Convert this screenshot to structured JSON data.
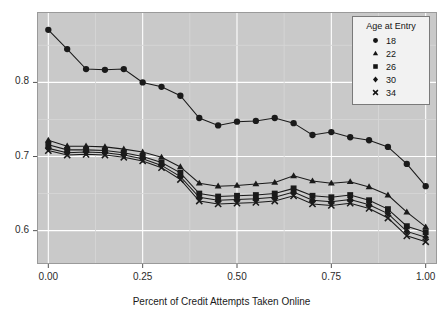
{
  "chart_data": {
    "type": "line",
    "title": "",
    "xlabel": "Percent of Credit Attempts Taken Online",
    "ylabel": "",
    "xlim": [
      -0.03,
      1.03
    ],
    "ylim": [
      0.555,
      0.895
    ],
    "xticks": [
      0.0,
      0.25,
      0.5,
      0.75,
      1.0
    ],
    "xtick_labels": [
      "0.00",
      "0.25",
      "0.50",
      "0.75",
      "1.00"
    ],
    "yticks": [
      0.6,
      0.7,
      0.8
    ],
    "ytick_labels": [
      "0.6",
      "0.7",
      "0.8"
    ],
    "grid": true,
    "grid_color": "#ffffff",
    "panel_color": "#c9c9c9",
    "legend": {
      "title": "Age at Entry",
      "position": "top-right",
      "entries": [
        {
          "label": "18",
          "marker": "circle"
        },
        {
          "label": "22",
          "marker": "triangle"
        },
        {
          "label": "26",
          "marker": "square"
        },
        {
          "label": "30",
          "marker": "diamond"
        },
        {
          "label": "34",
          "marker": "cross"
        }
      ]
    },
    "x": [
      0.0,
      0.05,
      0.1,
      0.15,
      0.2,
      0.25,
      0.3,
      0.35,
      0.4,
      0.45,
      0.5,
      0.55,
      0.6,
      0.65,
      0.7,
      0.75,
      0.8,
      0.85,
      0.9,
      0.95,
      1.0
    ],
    "series": [
      {
        "name": "18",
        "marker": "circle",
        "color": "#1a1a1a",
        "values": [
          0.871,
          0.845,
          0.818,
          0.817,
          0.818,
          0.8,
          0.794,
          0.782,
          0.752,
          0.742,
          0.747,
          0.748,
          0.752,
          0.745,
          0.729,
          0.733,
          0.726,
          0.722,
          0.713,
          0.69,
          0.66
        ]
      },
      {
        "name": "22",
        "marker": "triangle",
        "color": "#1a1a1a",
        "values": [
          0.722,
          0.714,
          0.714,
          0.713,
          0.71,
          0.706,
          0.699,
          0.686,
          0.664,
          0.66,
          0.661,
          0.663,
          0.665,
          0.674,
          0.667,
          0.664,
          0.666,
          0.659,
          0.648,
          0.625,
          0.605
        ]
      },
      {
        "name": "26",
        "marker": "square",
        "color": "#1a1a1a",
        "values": [
          0.716,
          0.709,
          0.709,
          0.708,
          0.705,
          0.7,
          0.692,
          0.678,
          0.65,
          0.646,
          0.647,
          0.648,
          0.65,
          0.657,
          0.647,
          0.645,
          0.648,
          0.641,
          0.629,
          0.606,
          0.598
        ]
      },
      {
        "name": "30",
        "marker": "diamond",
        "color": "#1a1a1a",
        "values": [
          0.711,
          0.705,
          0.706,
          0.705,
          0.702,
          0.697,
          0.688,
          0.673,
          0.645,
          0.641,
          0.642,
          0.643,
          0.645,
          0.652,
          0.641,
          0.639,
          0.642,
          0.635,
          0.623,
          0.599,
          0.591
        ]
      },
      {
        "name": "34",
        "marker": "cross",
        "color": "#1a1a1a",
        "values": [
          0.708,
          0.702,
          0.703,
          0.702,
          0.699,
          0.694,
          0.685,
          0.669,
          0.64,
          0.636,
          0.637,
          0.638,
          0.64,
          0.647,
          0.636,
          0.634,
          0.637,
          0.63,
          0.617,
          0.593,
          0.585
        ]
      }
    ]
  }
}
